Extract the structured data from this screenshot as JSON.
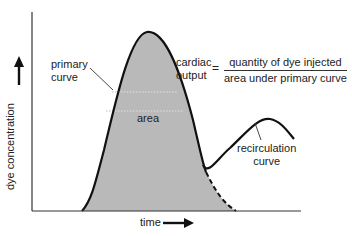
{
  "diagram": {
    "axes": {
      "x_label": "time",
      "y_label": "dye concentration",
      "x_arrow": "right-arrow",
      "y_arrow": "up-arrow"
    },
    "labels": {
      "primary_curve": [
        "primary",
        "curve"
      ],
      "area": "area",
      "recirculation_curve": [
        "recirculation",
        "curve"
      ]
    },
    "formula": {
      "lhs": [
        "cardiac",
        "output"
      ],
      "operator": "=",
      "numerator": "quantity of dye injected",
      "denominator": "area under primary curve"
    },
    "colors": {
      "area_fill": "#b9b9b9",
      "curve_stroke": "#111111",
      "axis_stroke": "#333333",
      "background": "#ffffff"
    }
  }
}
